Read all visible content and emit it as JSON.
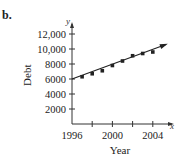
{
  "part_label": "b.",
  "chart_data": {
    "type": "scatter",
    "title": "",
    "xlabel": "Year",
    "ylabel": "Debt",
    "x_axis_symbol": "x",
    "y_axis_symbol": "y",
    "x_ticks": [
      1996,
      1998,
      2000,
      2002,
      2004
    ],
    "x_tick_labels": [
      "1996",
      "2000",
      "2004"
    ],
    "y_ticks": [
      2000,
      4000,
      6000,
      8000,
      10000,
      12000
    ],
    "y_tick_labels": [
      "2000",
      "4000",
      "6000",
      "8000",
      "10,000",
      "12,000"
    ],
    "xlim": [
      1996,
      2006
    ],
    "ylim": [
      0,
      13000
    ],
    "series": [
      {
        "name": "data points",
        "x": [
          1997,
          1998,
          1999,
          2000,
          2001,
          2002,
          2003,
          2004
        ],
        "y": [
          6300,
          6700,
          7100,
          7800,
          8400,
          9100,
          9400,
          9600
        ]
      }
    ],
    "fit_line": {
      "x": [
        1996,
        2005.3
      ],
      "y": [
        6000,
        10600
      ],
      "arrow": true
    },
    "grid": false,
    "legend": null
  }
}
